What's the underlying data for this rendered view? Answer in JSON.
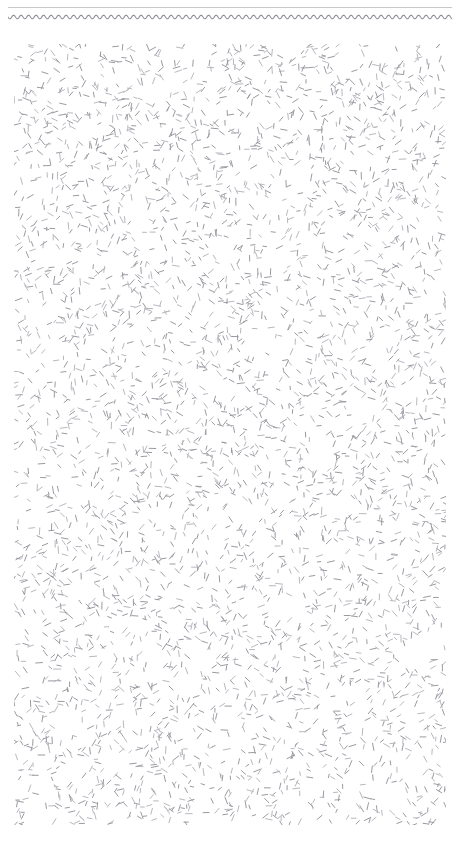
{
  "page": {
    "title": "Abstract Texture Page",
    "width": 460,
    "height": 846,
    "background_color": "#ffffff"
  },
  "header": {
    "straight_rule": {
      "name": "horizontal-rule",
      "color": "#c8c8cc",
      "x": 8,
      "y": 7,
      "width": 444,
      "thickness": 1
    },
    "wavy_rule": {
      "name": "wavy-rule",
      "color": "#8e8e96",
      "x": 8,
      "y": 17,
      "width": 444,
      "amplitude": 1.8,
      "wavelength": 7.5,
      "thickness": 1.1
    }
  },
  "texture": {
    "name": "dash-texture-field",
    "x": 14,
    "y": 44,
    "width": 432,
    "height": 781,
    "mark_color": "#9a9aa2",
    "mark_color_light": "#b8b8c0",
    "mark_length_min": 4,
    "mark_length_max": 8,
    "mark_thickness": 1,
    "mark_count": 4200,
    "orientation": "random",
    "description": "Dense field of short randomly-oriented gray dash strokes"
  },
  "chart_data": {
    "type": "scatter",
    "title": "",
    "xlabel": "",
    "ylabel": "",
    "grid": false,
    "legend": "none",
    "xlim": [
      0,
      432
    ],
    "ylim": [
      0,
      781
    ],
    "series": [
      {
        "name": "dash-marks",
        "marker": "short-line-segment",
        "color": "#9a9aa2",
        "count": 4200
      }
    ]
  }
}
